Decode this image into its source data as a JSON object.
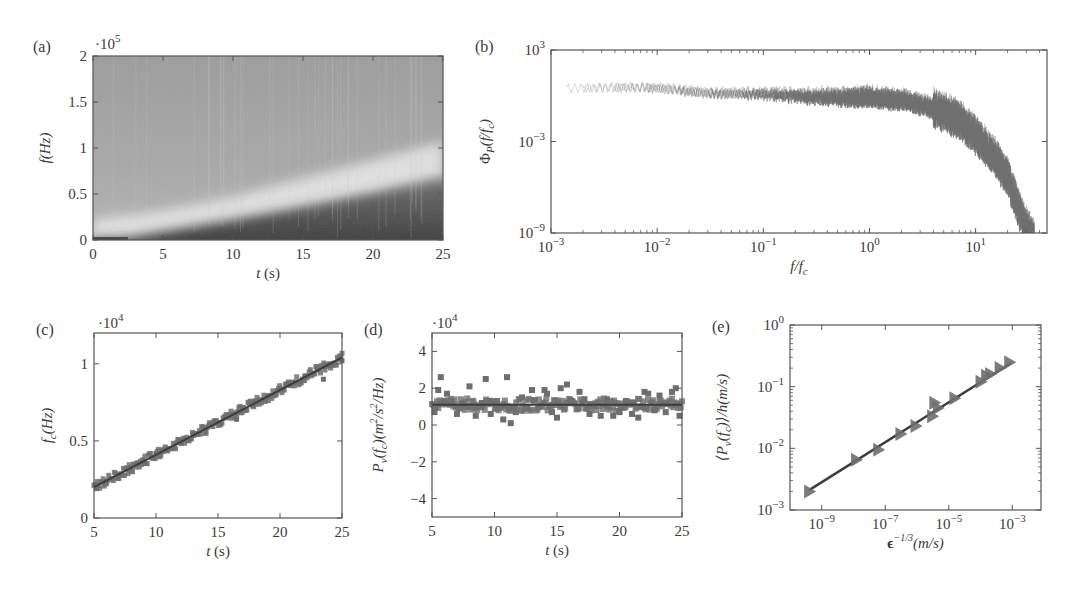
{
  "figure": {
    "panels": [
      "(a)",
      "(b)",
      "(c)",
      "(d)",
      "(e)"
    ]
  },
  "chart_data": [
    {
      "id": "a",
      "type": "heatmap",
      "panel_label": "(a)",
      "title": "",
      "xlabel": "t (s)",
      "ylabel": "f (Hz)",
      "y_multiplier": "·10^5",
      "xlim": [
        0,
        25
      ],
      "ylim": [
        0,
        2
      ],
      "xticks": [
        0,
        5,
        10,
        15,
        20,
        25
      ],
      "yticks": [
        0,
        0.5,
        1,
        1.5,
        2
      ],
      "ytick_labels": [
        "0",
        "0.5",
        "1",
        "1.5",
        "2"
      ],
      "description": "Spectrogram; dark low-frequency region below a rising cutoff boundary, lighter band above it, medium grey background",
      "boundary_curve": {
        "t": [
          0,
          2.5,
          5,
          10,
          15,
          20,
          25
        ],
        "f_e5": [
          0.0,
          0.02,
          0.09,
          0.22,
          0.36,
          0.5,
          0.65
        ]
      },
      "bright_band": {
        "t": [
          0,
          5,
          10,
          15,
          20,
          25
        ],
        "f_e5": [
          0.1,
          0.2,
          0.35,
          0.55,
          0.75,
          0.95
        ]
      },
      "grid": false
    },
    {
      "id": "b",
      "type": "line",
      "panel_label": "(b)",
      "title": "",
      "xlabel": "f/f_c",
      "ylabel": "Φ_P(f/f_c)",
      "xscale": "log",
      "yscale": "log",
      "xlim": [
        0.001,
        47
      ],
      "ylim": [
        1e-09,
        1000
      ],
      "xticks": [
        0.001,
        0.01,
        0.1,
        1,
        10
      ],
      "xtick_labels": [
        "10^-3",
        "10^-2",
        "10^-1",
        "10^0",
        "10^1"
      ],
      "yticks": [
        1e-09,
        0.001,
        1000
      ],
      "ytick_labels": [
        "10^-9",
        "10^-3",
        "10^3"
      ],
      "description": "Collapsed normalized spectra of many time windows: flat plateau ~1 up to f/f_c≈2, then steep roll-off to 1e-9 near f/f_c≈35",
      "series": [
        {
          "name": "collapsed spectra (envelope)",
          "x": [
            0.0015,
            0.005,
            0.01,
            0.03,
            0.1,
            0.3,
            1,
            2,
            4,
            7,
            10,
            15,
            20,
            25,
            30,
            35
          ],
          "y": [
            3,
            4,
            4,
            2,
            2,
            1.5,
            1.5,
            1.0,
            0.3,
            0.05,
            0.005,
            0.0002,
            1e-05,
            1e-07,
            5e-09,
            1e-09
          ]
        }
      ],
      "grid": false
    },
    {
      "id": "c",
      "type": "scatter",
      "panel_label": "(c)",
      "title": "",
      "xlabel": "t (s)",
      "ylabel": "f_c (Hz)",
      "y_multiplier": "·10^4",
      "xlim": [
        5,
        25
      ],
      "ylim": [
        0,
        1.2
      ],
      "xticks": [
        5,
        10,
        15,
        20,
        25
      ],
      "yticks": [
        0,
        0.5,
        1
      ],
      "ytick_labels": [
        "0",
        "0.5",
        "1"
      ],
      "fit_line": {
        "x": [
          5,
          25
        ],
        "y": [
          0.2,
          1.04
        ]
      },
      "series": [
        {
          "name": "f_c(t) data",
          "x": [
            5.2,
            6,
            7,
            8,
            9,
            10,
            11,
            12,
            13,
            14,
            15,
            16,
            16.5,
            17,
            18,
            19,
            20,
            21,
            22,
            23,
            23.5,
            24,
            25
          ],
          "y": [
            0.19,
            0.24,
            0.28,
            0.33,
            0.37,
            0.42,
            0.45,
            0.49,
            0.54,
            0.58,
            0.62,
            0.67,
            0.64,
            0.71,
            0.76,
            0.79,
            0.83,
            0.88,
            0.92,
            0.96,
            0.9,
            1.0,
            1.02
          ]
        }
      ],
      "grid": false
    },
    {
      "id": "d",
      "type": "scatter",
      "panel_label": "(d)",
      "title": "",
      "xlabel": "t (s)",
      "ylabel": "P_v(f_c)(m^2/s^2/Hz)",
      "y_multiplier": "·10^4",
      "xlim": [
        5,
        25
      ],
      "ylim": [
        -5,
        5
      ],
      "xticks": [
        5,
        10,
        15,
        20,
        25
      ],
      "yticks": [
        -4,
        -2,
        0,
        2,
        4
      ],
      "ytick_labels": [
        "−4",
        "−2",
        "0",
        "2",
        "4"
      ],
      "fit_line": {
        "x": [
          5,
          25
        ],
        "y": [
          1.1,
          1.1
        ]
      },
      "series": [
        {
          "name": "P_v(f_c) data",
          "x": [
            5.2,
            5.5,
            5.7,
            6.2,
            6.5,
            7,
            7.5,
            8,
            8.5,
            9,
            9.3,
            9.7,
            10.2,
            10.7,
            11,
            11.3,
            11.7,
            12.2,
            12.6,
            13,
            13.5,
            14,
            14.2,
            14.6,
            15,
            15.3,
            15.8,
            16.2,
            16.8,
            17.2,
            17.6,
            18,
            18.5,
            19,
            19.5,
            20,
            20.5,
            21,
            21.5,
            22,
            22.3,
            22.8,
            23.2,
            23.7,
            24.2,
            24.5,
            24.8
          ],
          "y": [
            0.7,
            1.9,
            2.6,
            1.7,
            1.3,
            0.6,
            1.2,
            2.1,
            0.5,
            1.2,
            2.5,
            0.6,
            1.3,
            0.3,
            2.6,
            0.1,
            0.7,
            1.5,
            0.9,
            1.9,
            1.0,
            1.9,
            1.7,
            0.7,
            0.4,
            2.0,
            2.2,
            1.3,
            1.8,
            1.4,
            0.6,
            1.1,
            0.5,
            1.4,
            0.5,
            0.7,
            1.3,
            0.6,
            0.4,
            1.8,
            1.7,
            0.8,
            1.6,
            0.7,
            1.8,
            2.0,
            0.5
          ]
        }
      ],
      "grid": false
    },
    {
      "id": "e",
      "type": "scatter",
      "panel_label": "(e)",
      "title": "",
      "xlabel": "ϵ^(-1/3)(m/s)",
      "ylabel": "⟨P_v(f_c)⟩/h(m/s)",
      "xscale": "log",
      "yscale": "log",
      "xlim": [
        1e-10,
        0.008
      ],
      "ylim": [
        0.001,
        1
      ],
      "xticks": [
        1e-09,
        1e-07,
        1e-05,
        0.001
      ],
      "xtick_labels": [
        "10^-9",
        "10^-7",
        "10^-5",
        "10^-3"
      ],
      "yticks": [
        0.001,
        0.01,
        0.1,
        1
      ],
      "ytick_labels": [
        "10^-3",
        "10^-2",
        "10^-1",
        "10^0"
      ],
      "marker": "right-pointing triangle",
      "fit_line": {
        "x": [
          4e-10,
          0.0009
        ],
        "y": [
          0.0021,
          0.24
        ]
      },
      "series": [
        {
          "name": "data",
          "x": [
            4e-10,
            1.2e-08,
            6e-08,
            3e-07,
            9e-07,
            3e-06,
            3.5e-06,
            4.5e-06,
            1.5e-05,
            0.0001,
            0.00015,
            0.0002,
            0.0004,
            0.0008
          ],
          "y": [
            0.002,
            0.0065,
            0.0095,
            0.017,
            0.023,
            0.033,
            0.055,
            0.045,
            0.065,
            0.12,
            0.15,
            0.16,
            0.2,
            0.25
          ]
        }
      ],
      "grid": false
    }
  ],
  "colors": {
    "axis": "#555555",
    "marker": "#6e6e6e",
    "fit_line": "#3c3c3c",
    "spectrum": "#707070",
    "heatmap_dark": "#3a3a3a",
    "heatmap_light": "#e2e2e2",
    "heatmap_mid": "#a8a8a8"
  }
}
